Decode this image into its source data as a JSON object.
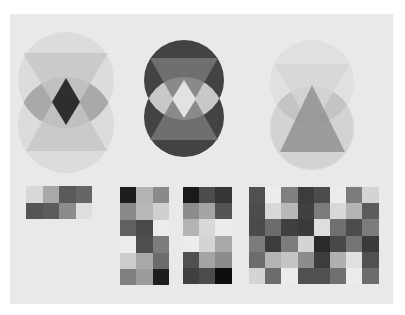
{
  "artwork": {
    "description": "Watercolor study of overlapping circles and triangles above grids of gray squares",
    "paper_color": "#e9e9e9",
    "background_color": "#ffffff"
  },
  "figures": [
    {
      "name": "figure-light-circles-dark-diamond",
      "circles": [
        {
          "cx": 66,
          "cy": 80,
          "r": 48,
          "fill": "#d9d9d9"
        },
        {
          "cx": 66,
          "cy": 125,
          "r": 48,
          "fill": "#d9d9d9"
        }
      ],
      "lens_fill": "#a9a9a9",
      "triangle_down": {
        "points": "23,53 108,53 66,125",
        "fill": "#c6c6c6"
      },
      "triangle_up": {
        "points": "26,151 107,151 66,78",
        "fill": "#c6c6c6"
      },
      "diamond": {
        "points": "66,78 80,102 66,125 52,102",
        "fill": "#2e2e2e"
      }
    },
    {
      "name": "figure-dark-circles-light-diamond",
      "circles": [
        {
          "cx": 184,
          "cy": 80,
          "r": 40,
          "fill": "#262626"
        },
        {
          "cx": 184,
          "cy": 117,
          "r": 40,
          "fill": "#262626"
        }
      ],
      "lens_fill": "#c8c8c8",
      "triangle_down": {
        "points": "150,58 218,58 184,118",
        "fill": "#7a7a7a"
      },
      "triangle_up": {
        "points": "150,140 218,140 184,80",
        "fill": "#7a7a7a"
      },
      "diamond": {
        "points": "184,80 196,99 184,118 172,99",
        "fill": "#e2e2e2"
      }
    },
    {
      "name": "figure-single-triangle",
      "circles": [
        {
          "cx": 312,
          "cy": 82,
          "r": 42,
          "fill": "#dedede"
        },
        {
          "cx": 312,
          "cy": 128,
          "r": 42,
          "fill": "#cfcfcf"
        }
      ],
      "lens_fill": "#c4c4c4",
      "triangle_down": {
        "points": "274,64 350,64 312,128",
        "fill": "#d6d6d6"
      },
      "triangle_up": {
        "points": "280,152 345,152 312,85",
        "fill": "#8f8f8f"
      },
      "diamond": null
    }
  ],
  "grids": [
    {
      "name": "grid-4x2",
      "x": 26,
      "y": 186,
      "cols": 4,
      "rows": 2,
      "cell": 16.5,
      "cells": [
        [
          "#d8d8d8",
          "#a8a8a8",
          "#5a5a5a",
          "#666666"
        ],
        [
          "#555555",
          "#5c5c5c",
          "#8c8c8c",
          "#dedede"
        ]
      ]
    },
    {
      "name": "grid-3x6-a",
      "x": 120,
      "y": 187,
      "cols": 3,
      "rows": 6,
      "cell": 16.4,
      "cells": [
        [
          "#1e1e1e",
          "#b4b4b4",
          "#8a8a8a"
        ],
        [
          "#8a8a8a",
          "#b8b8b8",
          "#cfcfcf"
        ],
        [
          "#606060",
          "#4a4a4a",
          "#ececec"
        ],
        [
          "#ececec",
          "#4e4e4e",
          "#7c7c7c"
        ],
        [
          "#cccccc",
          "#a8a8a8",
          "#6c6c6c"
        ],
        [
          "#808080",
          "#9c9c9c",
          "#1e1e1e"
        ]
      ]
    },
    {
      "name": "grid-3x6-b",
      "x": 183,
      "y": 187,
      "cols": 3,
      "rows": 6,
      "cell": 16.2,
      "cells": [
        [
          "#1a1a1a",
          "#4c4c4c",
          "#363636"
        ],
        [
          "#8c8c8c",
          "#a4a4a4",
          "#545454"
        ],
        [
          "#b4b4b4",
          "#d8d8d8",
          "#ececec"
        ],
        [
          "#ececec",
          "#d4d4d4",
          "#a8a8a8"
        ],
        [
          "#505050",
          "#a4a4a4",
          "#8c8c8c"
        ],
        [
          "#404040",
          "#4c4c4c",
          "#0e0e0e"
        ]
      ]
    },
    {
      "name": "grid-8x6",
      "x": 249,
      "y": 187,
      "cols": 8,
      "rows": 6,
      "cell": 16.2,
      "cells": [
        [
          "#505050",
          "#ececec",
          "#808080",
          "#3c3c3c",
          "#4c4c4c",
          "#ececec",
          "#7c7c7c",
          "#d4d4d4"
        ],
        [
          "#4c4c4c",
          "#d8d8d8",
          "#b8b8b8",
          "#404040",
          "#7c7c7c",
          "#d8d8d8",
          "#b4b4b4",
          "#5c5c5c"
        ],
        [
          "#4a4a4a",
          "#6c6c6c",
          "#404040",
          "#3a3a3a",
          "#dedede",
          "#707070",
          "#4c4c4c",
          "#7c7c7c"
        ],
        [
          "#7c7c7c",
          "#3c3c3c",
          "#7c7c7c",
          "#d4d4d4",
          "#2a2a2a",
          "#484848",
          "#747474",
          "#3a3a3a"
        ],
        [
          "#6c6c6c",
          "#b4b4b4",
          "#c4c4c4",
          "#8c8c8c",
          "#3c3c3c",
          "#b0b0b0",
          "#e0e0e0",
          "#505050"
        ],
        [
          "#d4d4d4",
          "#6c6c6c",
          "#ececec",
          "#505050",
          "#505050",
          "#707070",
          "#ececec",
          "#6c6c6c"
        ]
      ]
    }
  ]
}
